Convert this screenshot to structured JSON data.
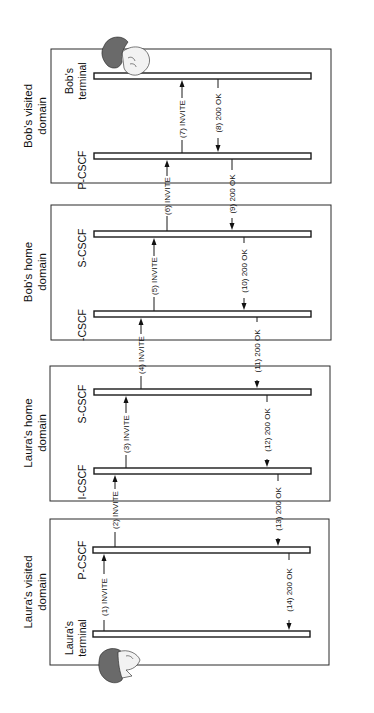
{
  "diagram": {
    "orientation": "rotated-90-ccw",
    "domains": [
      {
        "id": "bob_visited",
        "title_line1": "Bob's visited",
        "title_line2": "domain",
        "nodes": [
          "Bob's terminal",
          "P-CSCF"
        ]
      },
      {
        "id": "bob_home",
        "title_line1": "Bob's home",
        "title_line2": "domain",
        "nodes": [
          "S-CSCF",
          "-CSCF"
        ]
      },
      {
        "id": "laura_home",
        "title_line1": "Laura's home",
        "title_line2": "domain",
        "nodes": [
          "S-CSCF",
          "I-CSCF"
        ]
      },
      {
        "id": "laura_visited",
        "title_line1": "Laura's visited",
        "title_line2": "domain",
        "nodes": [
          "P-CSCF",
          "Laura's terminal"
        ]
      }
    ],
    "nodes": {
      "bob_terminal_l1": "Bob's",
      "bob_terminal_l2": "terminal",
      "bob_pcscf": "P-CSCF",
      "bob_scscf": "S-CSCF",
      "bob_icscf": "-CSCF",
      "laura_scscf": "S-CSCF",
      "laura_icscf": "I-CSCF",
      "laura_pcscf": "P-CSCF",
      "laura_terminal_l1": "Laura's",
      "laura_terminal_l2": "terminal"
    },
    "messages": [
      {
        "n": "(1) INVITE",
        "from": "Laura's terminal",
        "to": "P-CSCF (Laura)"
      },
      {
        "n": "(2) INVITE",
        "from": "P-CSCF (Laura)",
        "to": "I-CSCF (Laura)"
      },
      {
        "n": "(3) INVITE",
        "from": "I-CSCF (Laura)",
        "to": "S-CSCF (Laura)"
      },
      {
        "n": "(4) INVITE",
        "from": "S-CSCF (Laura)",
        "to": "I-CSCF (Bob)"
      },
      {
        "n": "(5) INVITE",
        "from": "I-CSCF (Bob)",
        "to": "S-CSCF (Bob)"
      },
      {
        "n": "(6) INVITE",
        "from": "S-CSCF (Bob)",
        "to": "P-CSCF (Bob)"
      },
      {
        "n": "(7) INVITE",
        "from": "P-CSCF (Bob)",
        "to": "Bob's terminal"
      },
      {
        "n": "(8) 200 OK",
        "from": "Bob's terminal",
        "to": "P-CSCF (Bob)"
      },
      {
        "n": "(9) 200 OK",
        "from": "P-CSCF (Bob)",
        "to": "S-CSCF (Bob)"
      },
      {
        "n": "(10) 200 OK",
        "from": "S-CSCF (Bob)",
        "to": "I-CSCF (Bob)"
      },
      {
        "n": "(11) 200 OK",
        "from": "I-CSCF (Bob)",
        "to": "S-CSCF (Laura)"
      },
      {
        "n": "(12) 200 OK",
        "from": "S-CSCF (Laura)",
        "to": "I-CSCF (Laura)"
      },
      {
        "n": "(13) 200 OK",
        "from": "I-CSCF (Laura)",
        "to": "P-CSCF (Laura)"
      },
      {
        "n": "(14) 200 OK",
        "from": "P-CSCF (Laura)",
        "to": "Laura's terminal"
      }
    ],
    "icons": [
      "bob-head-icon",
      "laura-head-icon"
    ]
  }
}
